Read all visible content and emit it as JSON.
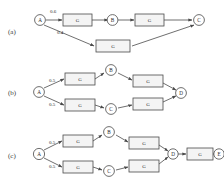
{
  "figure": {
    "panels": [
      {
        "id": "a",
        "label": "(a)",
        "nodes": [
          {
            "id": "A",
            "label": "A"
          },
          {
            "id": "B",
            "label": "B"
          },
          {
            "id": "C",
            "label": "C"
          }
        ],
        "boxes": [
          {
            "id": "g1",
            "label": "G"
          },
          {
            "id": "g2",
            "label": "G"
          },
          {
            "id": "g3",
            "label": "G"
          }
        ],
        "weights": [
          {
            "id": "w-top",
            "value": "0.6"
          },
          {
            "id": "w-bottom",
            "value": "0.4"
          }
        ]
      },
      {
        "id": "b",
        "label": "(b)",
        "nodes": [
          {
            "id": "A",
            "label": "A"
          },
          {
            "id": "B",
            "label": "B"
          },
          {
            "id": "C",
            "label": "C"
          },
          {
            "id": "D",
            "label": "D"
          }
        ],
        "boxes": [
          {
            "id": "g1",
            "label": "G"
          },
          {
            "id": "g2",
            "label": "G"
          },
          {
            "id": "g3",
            "label": "G"
          },
          {
            "id": "g4",
            "label": "G"
          }
        ],
        "weights": [
          {
            "id": "w-top",
            "value": "0.5"
          },
          {
            "id": "w-bottom",
            "value": "0.5"
          }
        ]
      },
      {
        "id": "c",
        "label": "(c)",
        "nodes": [
          {
            "id": "A",
            "label": "A"
          },
          {
            "id": "B",
            "label": "B"
          },
          {
            "id": "C",
            "label": "C"
          },
          {
            "id": "D",
            "label": "D"
          },
          {
            "id": "E",
            "label": "E"
          }
        ],
        "boxes": [
          {
            "id": "g1",
            "label": "G"
          },
          {
            "id": "g2",
            "label": "G"
          },
          {
            "id": "g3",
            "label": "G"
          },
          {
            "id": "g4",
            "label": "G"
          },
          {
            "id": "g5",
            "label": "G"
          }
        ],
        "weights": [
          {
            "id": "w-top",
            "value": "0.5"
          },
          {
            "id": "w-bottom",
            "value": "0.5"
          }
        ]
      }
    ],
    "colors": {
      "stroke": "#4a4a4a",
      "box_fill": "#f4f4f4",
      "node_fill": "#ffffff",
      "text": "#2b2b2b",
      "background": "#ffffff"
    }
  }
}
